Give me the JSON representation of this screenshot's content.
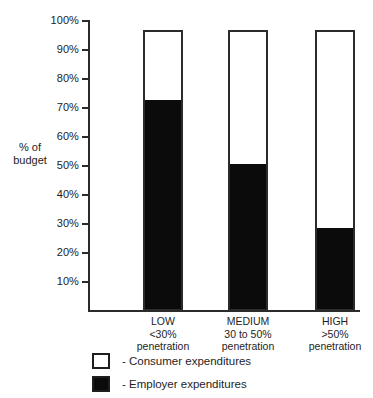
{
  "chart_data": {
    "type": "bar",
    "subtype": "stacked-100",
    "title": "",
    "xlabel": "",
    "ylabel": "% of budget",
    "ylim": [
      0,
      100
    ],
    "grid": false,
    "legend_position": "bottom-left",
    "categories": [
      "LOW\n<30%\npenetration",
      "MEDIUM\n30 to 50%\npenetration",
      "HIGH\n>50%\npenetration"
    ],
    "category_lines": [
      [
        "LOW",
        "<30%",
        "penetration"
      ],
      [
        "MEDIUM",
        "30 to 50%",
        "penetration"
      ],
      [
        "HIGH",
        ">50%",
        "penetration"
      ]
    ],
    "tick_labels": [
      "100%",
      "90%",
      "80%",
      "70%",
      "60%",
      "50%",
      "40%",
      "30%",
      "20%",
      "10%"
    ],
    "tick_values": [
      100,
      90,
      80,
      70,
      60,
      50,
      40,
      30,
      20,
      10
    ],
    "bar_total": 97,
    "series": [
      {
        "name": "Employer expenditures",
        "color": "#0b0b0b",
        "values": [
          72,
          50,
          28
        ]
      },
      {
        "name": "Consumer expenditures",
        "color": "#ffffff",
        "values": [
          25,
          47,
          69
        ]
      }
    ],
    "legend": [
      {
        "marker": "open-square",
        "label": "- Consumer expenditures"
      },
      {
        "marker": "solid-square",
        "label": "- Employer expenditures"
      }
    ]
  },
  "axis": {
    "y_label_line1": "% of",
    "y_label_line2": "budget"
  },
  "title_remnant": ""
}
